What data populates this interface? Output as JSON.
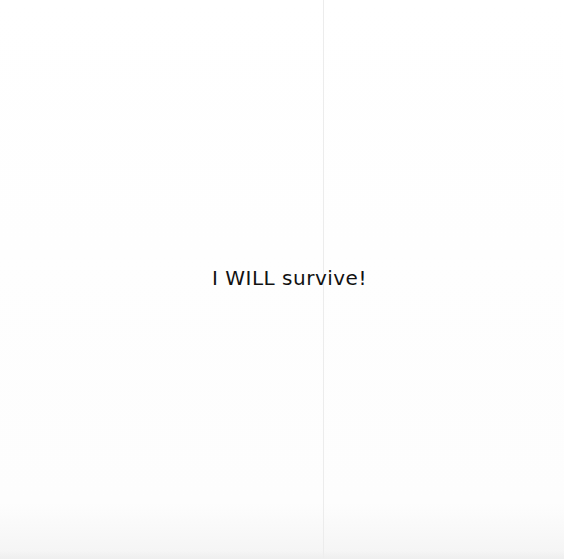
{
  "card": {
    "message": "I WILL survive!",
    "text_color": "#111111",
    "background_color": "#fefefe"
  }
}
